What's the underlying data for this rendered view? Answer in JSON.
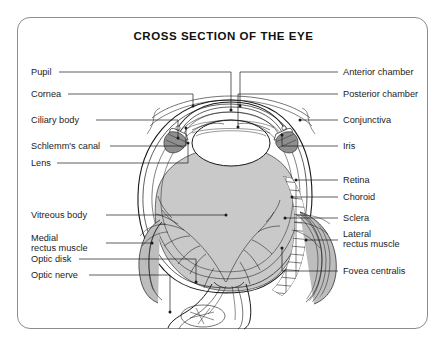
{
  "page": {
    "header_fragment": "   ",
    "background_color": "#ffffff"
  },
  "diagram": {
    "title": "CROSS SECTION OF THE EYE",
    "frame_border_color": "#8c8c8c",
    "vitreous_fill_color": "#c9c9c9",
    "line_color": "#1a1a1a",
    "labels_left": [
      {
        "text": "Pupil",
        "leader_to": "pupil-point"
      },
      {
        "text": "Cornea",
        "leader_to": "cornea-point"
      },
      {
        "text": "Ciliary body",
        "leader_to": "ciliary-body-point"
      },
      {
        "text": "Schlemm's canal",
        "leader_to": "schlemms-canal-point"
      },
      {
        "text": "Lens",
        "leader_to": "lens-point"
      },
      {
        "text": "Vitreous body",
        "leader_to": "vitreous-body-point"
      },
      {
        "text": "Medial\nrectus muscle",
        "leader_to": "medial-rectus-muscle-point"
      },
      {
        "text": "Optic disk",
        "leader_to": "optic-disk-point"
      },
      {
        "text": "Optic nerve",
        "leader_to": "optic-nerve-point"
      }
    ],
    "labels_right": [
      {
        "text": "Anterior chamber",
        "leader_to": "anterior-chamber-point"
      },
      {
        "text": "Posterior chamber",
        "leader_to": "posterior-chamber-point"
      },
      {
        "text": "Conjunctiva",
        "leader_to": "conjunctiva-point"
      },
      {
        "text": "Iris",
        "leader_to": "iris-point"
      },
      {
        "text": "Retina",
        "leader_to": "retina-point"
      },
      {
        "text": "Choroid",
        "leader_to": "choroid-point"
      },
      {
        "text": "Sclera",
        "leader_to": "sclera-point"
      },
      {
        "text": "Lateral\nrectus muscle",
        "leader_to": "lateral-rectus-muscle-point"
      },
      {
        "text": "Fovea centralis",
        "leader_to": "fovea-centralis-point"
      }
    ]
  }
}
